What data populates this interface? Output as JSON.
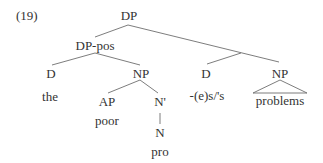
{
  "example_number": "(19)",
  "tree": {
    "root": "DP",
    "dp_pos": "DP-pos",
    "dp_pos_children": {
      "d": "D",
      "d_word": "the",
      "np": "NP",
      "ap": "AP",
      "ap_word": "poor",
      "nbar": "N'",
      "n": "N",
      "n_word": "pro"
    },
    "right": {
      "d": "D",
      "d_word": "-(e)s/'s",
      "np": "NP",
      "np_word": "problems"
    }
  },
  "colors": {
    "text": "#333333",
    "lines": "#6e6e6e"
  }
}
